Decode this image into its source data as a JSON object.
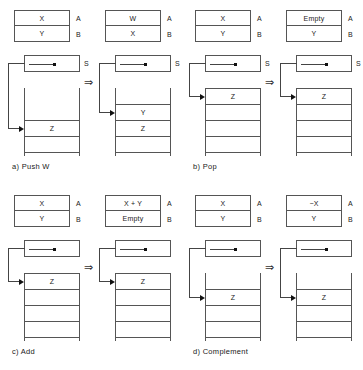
{
  "figure": {
    "implies_symbol": "⇒",
    "panels": [
      {
        "id": "a",
        "caption": "a)  Push W",
        "before": {
          "registers": [
            {
              "value": "X",
              "tag": "A"
            },
            {
              "value": "Y",
              "tag": "B"
            }
          ],
          "pointer_label": "S",
          "stack_cells": [
            "",
            "",
            "Z",
            ""
          ]
        },
        "after": {
          "registers": [
            {
              "value": "W",
              "tag": "A"
            },
            {
              "value": "X",
              "tag": "B"
            }
          ],
          "pointer_label": "S",
          "stack_cells": [
            "",
            "Y",
            "Z",
            ""
          ]
        }
      },
      {
        "id": "b",
        "caption": "b)  Pop",
        "before": {
          "registers": [
            {
              "value": "X",
              "tag": "A"
            },
            {
              "value": "Y",
              "tag": "B"
            }
          ],
          "pointer_label": "S",
          "stack_cells": [
            "Z",
            "",
            "",
            ""
          ]
        },
        "after": {
          "registers": [
            {
              "value": "Empty",
              "tag": "A"
            },
            {
              "value": "Y",
              "tag": "B"
            }
          ],
          "pointer_label": "S",
          "stack_cells": [
            "Z",
            "",
            "",
            ""
          ]
        }
      },
      {
        "id": "c",
        "caption": "c)  Add",
        "before": {
          "registers": [
            {
              "value": "X",
              "tag": "A"
            },
            {
              "value": "Y",
              "tag": "B"
            }
          ],
          "pointer_label": "",
          "stack_cells": [
            "Z",
            "",
            "",
            ""
          ]
        },
        "after": {
          "registers": [
            {
              "value": "X + Y",
              "tag": "A"
            },
            {
              "value": "Empty",
              "tag": "B"
            }
          ],
          "pointer_label": "",
          "stack_cells": [
            "Z",
            "",
            "",
            ""
          ]
        }
      },
      {
        "id": "d",
        "caption": "d)  Complement",
        "before": {
          "registers": [
            {
              "value": "X",
              "tag": "A"
            },
            {
              "value": "Y",
              "tag": "B"
            }
          ],
          "pointer_label": "",
          "stack_cells": [
            "",
            "Z",
            "",
            ""
          ]
        },
        "after": {
          "registers": [
            {
              "value": "−X",
              "tag": "A"
            },
            {
              "value": "Y",
              "tag": "B"
            }
          ],
          "pointer_label": "",
          "stack_cells": [
            "",
            "Z",
            "",
            ""
          ]
        }
      }
    ]
  }
}
